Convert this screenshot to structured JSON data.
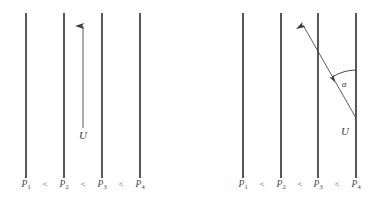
{
  "figure": {
    "title": "",
    "background_color": "#ffffff",
    "line_color": "#3a3a3a",
    "text_color": "#4a4a4a",
    "width": 384,
    "height": 205
  },
  "panels": [
    {
      "id": "left",
      "name": "normal-incidence-panel",
      "isobar_lines": [
        {
          "label": "P",
          "subscript": "1",
          "x": 26
        },
        {
          "label": "P",
          "subscript": "2",
          "x": 64
        },
        {
          "label": "P",
          "subscript": "3",
          "x": 102
        },
        {
          "label": "P",
          "subscript": "4",
          "x": 140
        }
      ],
      "inequality_symbol": "<",
      "inequality_positions": [
        45,
        83,
        121
      ],
      "velocity_arrow": {
        "label": "U",
        "x": 83,
        "y_tail": 128,
        "y_head": 22,
        "label_x": 83,
        "label_y": 136
      },
      "angle": null
    },
    {
      "id": "right",
      "name": "oblique-incidence-panel",
      "isobar_lines": [
        {
          "label": "P",
          "subscript": "1",
          "x": 51
        },
        {
          "label": "P",
          "subscript": "2",
          "x": 89
        },
        {
          "label": "P",
          "subscript": "3",
          "x": 126
        },
        {
          "label": "P",
          "subscript": "4",
          "x": 164
        }
      ],
      "inequality_symbol": "<",
      "inequality_positions": [
        70,
        108,
        145
      ],
      "velocity_arrow": {
        "label": "U",
        "x_tail": 164,
        "y_tail": 118,
        "x_head": 107,
        "y_head": 19,
        "label_x": 153,
        "label_y": 134
      },
      "angle": {
        "symbol": "α",
        "label_x": 152,
        "label_y": 86,
        "vertex_x": 164,
        "vertex_y": 118,
        "arc_start_x": 164,
        "arc_start_y": 70,
        "arc_end_x": 137,
        "arc_end_y": 78
      }
    }
  ],
  "line_geometry": {
    "y_top": 13,
    "y_bottom": 178
  }
}
